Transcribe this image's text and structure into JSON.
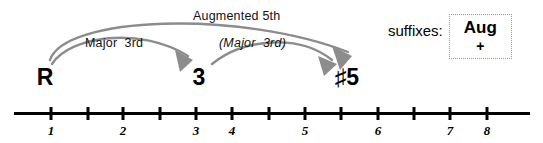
{
  "diagram": {
    "type": "fretboard-interval-diagram",
    "chord": "Augmented",
    "colors": {
      "arrow": "#8c8c8c",
      "text": "#000000",
      "line": "#000000",
      "box_border": "#9a9a9a",
      "background": "#ffffff"
    },
    "captions": [
      {
        "id": "augmented-5th",
        "text": "Augmented 5th",
        "italic": false,
        "x": 193,
        "y": 10
      },
      {
        "id": "major-3rd",
        "text": "Major  3rd",
        "italic": false,
        "x": 85,
        "y": 37
      },
      {
        "id": "major-3rd-paren",
        "text": "(Major  3rd)",
        "italic": true,
        "x": 219,
        "y": 37
      }
    ],
    "degrees": [
      {
        "id": "root",
        "label": "R",
        "x": 45,
        "y": 66
      },
      {
        "id": "third",
        "label": "3",
        "x": 199,
        "y": 66
      },
      {
        "id": "sharp-five",
        "label": "♯5",
        "x": 347,
        "y": 66
      }
    ],
    "arrows": [
      {
        "id": "root-to-third",
        "from": "R",
        "to": "3",
        "label": "Major  3rd",
        "path": "M 52 64 C 70 36 140 26 190 58",
        "head": "M 190 58 L 178 50 L 183 66 Z"
      },
      {
        "id": "third-to-sharp-five",
        "from": "3",
        "to": "♯5",
        "label": "(Major  3rd)",
        "path": "M 212 64 C 240 40 300 34 338 62",
        "head": "M 338 62 L 325 54 L 330 70 Z"
      },
      {
        "id": "root-to-sharp-five",
        "from": "R",
        "to": "♯5",
        "label": "Augmented 5th",
        "path": "M 50 60 C 64 16 240 10 348 52",
        "head": "M 348 52 L 334 48 L 344 66 Z"
      }
    ],
    "number_line": {
      "ticks": [
        {
          "x": 51,
          "label": "1"
        },
        {
          "x": 88,
          "label": ""
        },
        {
          "x": 123,
          "label": "2"
        },
        {
          "x": 160,
          "label": ""
        },
        {
          "x": 196,
          "label": "3"
        },
        {
          "x": 232,
          "label": "4"
        },
        {
          "x": 269,
          "label": ""
        },
        {
          "x": 305,
          "label": "5"
        },
        {
          "x": 341,
          "label": ""
        },
        {
          "x": 378,
          "label": "6"
        },
        {
          "x": 414,
          "label": ""
        },
        {
          "x": 450,
          "label": "7"
        },
        {
          "x": 487,
          "label": "8"
        }
      ]
    },
    "suffixes": {
      "label": "suffixes:",
      "primary": "Aug",
      "alternate": "+"
    }
  }
}
